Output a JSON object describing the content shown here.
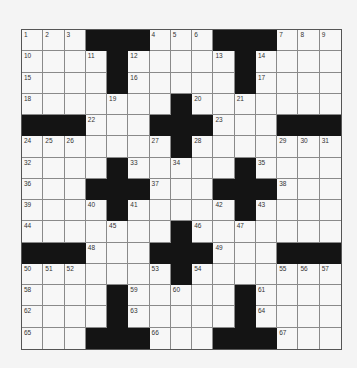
{
  "puzzle": {
    "rows": 15,
    "cols": 15,
    "colors": {
      "background": "#f4f4f4",
      "cell": "#f7f7f7",
      "block": "#141414",
      "gridline": "#8a8a8a"
    },
    "layout": [
      "...###...###...",
      "....#.....#....",
      "....#.....#....",
      ".......#.......",
      "###...###...###",
      ".......#.......",
      "....#.....#....",
      "...###...###...",
      "....#.....#....",
      ".......#.......",
      "###...###...###",
      ".......#.......",
      "....#.....#....",
      "....#.....#....",
      "...###...###..."
    ],
    "numbers": [
      {
        "r": 0,
        "c": 0,
        "n": "1"
      },
      {
        "r": 0,
        "c": 1,
        "n": "2"
      },
      {
        "r": 0,
        "c": 2,
        "n": "3"
      },
      {
        "r": 0,
        "c": 6,
        "n": "4"
      },
      {
        "r": 0,
        "c": 7,
        "n": "5"
      },
      {
        "r": 0,
        "c": 8,
        "n": "6"
      },
      {
        "r": 0,
        "c": 12,
        "n": "7"
      },
      {
        "r": 0,
        "c": 13,
        "n": "8"
      },
      {
        "r": 0,
        "c": 14,
        "n": "9"
      },
      {
        "r": 1,
        "c": 0,
        "n": "10"
      },
      {
        "r": 1,
        "c": 3,
        "n": "11"
      },
      {
        "r": 1,
        "c": 5,
        "n": "12"
      },
      {
        "r": 1,
        "c": 9,
        "n": "13"
      },
      {
        "r": 1,
        "c": 11,
        "n": "14"
      },
      {
        "r": 2,
        "c": 0,
        "n": "15"
      },
      {
        "r": 2,
        "c": 5,
        "n": "16"
      },
      {
        "r": 2,
        "c": 11,
        "n": "17"
      },
      {
        "r": 3,
        "c": 0,
        "n": "18"
      },
      {
        "r": 3,
        "c": 4,
        "n": "19"
      },
      {
        "r": 3,
        "c": 8,
        "n": "20"
      },
      {
        "r": 3,
        "c": 10,
        "n": "21"
      },
      {
        "r": 4,
        "c": 3,
        "n": "22"
      },
      {
        "r": 4,
        "c": 9,
        "n": "23"
      },
      {
        "r": 5,
        "c": 0,
        "n": "24"
      },
      {
        "r": 5,
        "c": 1,
        "n": "25"
      },
      {
        "r": 5,
        "c": 2,
        "n": "26"
      },
      {
        "r": 5,
        "c": 6,
        "n": "27"
      },
      {
        "r": 5,
        "c": 8,
        "n": "28"
      },
      {
        "r": 5,
        "c": 12,
        "n": "29"
      },
      {
        "r": 5,
        "c": 13,
        "n": "30"
      },
      {
        "r": 5,
        "c": 14,
        "n": "31"
      },
      {
        "r": 6,
        "c": 0,
        "n": "32"
      },
      {
        "r": 6,
        "c": 5,
        "n": "33"
      },
      {
        "r": 6,
        "c": 7,
        "n": "34"
      },
      {
        "r": 6,
        "c": 11,
        "n": "35"
      },
      {
        "r": 7,
        "c": 0,
        "n": "36"
      },
      {
        "r": 7,
        "c": 6,
        "n": "37"
      },
      {
        "r": 7,
        "c": 12,
        "n": "38"
      },
      {
        "r": 8,
        "c": 0,
        "n": "39"
      },
      {
        "r": 8,
        "c": 3,
        "n": "40"
      },
      {
        "r": 8,
        "c": 5,
        "n": "41"
      },
      {
        "r": 8,
        "c": 9,
        "n": "42"
      },
      {
        "r": 8,
        "c": 11,
        "n": "43"
      },
      {
        "r": 9,
        "c": 0,
        "n": "44"
      },
      {
        "r": 9,
        "c": 4,
        "n": "45"
      },
      {
        "r": 9,
        "c": 8,
        "n": "46"
      },
      {
        "r": 9,
        "c": 10,
        "n": "47"
      },
      {
        "r": 10,
        "c": 3,
        "n": "48"
      },
      {
        "r": 10,
        "c": 9,
        "n": "49"
      },
      {
        "r": 11,
        "c": 0,
        "n": "50"
      },
      {
        "r": 11,
        "c": 1,
        "n": "51"
      },
      {
        "r": 11,
        "c": 2,
        "n": "52"
      },
      {
        "r": 11,
        "c": 6,
        "n": "53"
      },
      {
        "r": 11,
        "c": 8,
        "n": "54"
      },
      {
        "r": 11,
        "c": 12,
        "n": "55"
      },
      {
        "r": 11,
        "c": 13,
        "n": "56"
      },
      {
        "r": 11,
        "c": 14,
        "n": "57"
      },
      {
        "r": 12,
        "c": 0,
        "n": "58"
      },
      {
        "r": 12,
        "c": 5,
        "n": "59"
      },
      {
        "r": 12,
        "c": 7,
        "n": "60"
      },
      {
        "r": 12,
        "c": 11,
        "n": "61"
      },
      {
        "r": 13,
        "c": 0,
        "n": "62"
      },
      {
        "r": 13,
        "c": 5,
        "n": "63"
      },
      {
        "r": 13,
        "c": 11,
        "n": "64"
      },
      {
        "r": 14,
        "c": 0,
        "n": "65"
      },
      {
        "r": 14,
        "c": 6,
        "n": "66"
      },
      {
        "r": 14,
        "c": 12,
        "n": "67"
      }
    ]
  }
}
